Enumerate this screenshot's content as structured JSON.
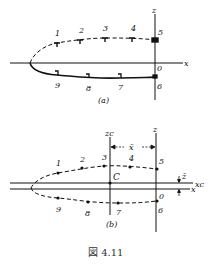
{
  "figure": {
    "caption": "図 4.11",
    "panel_a": {
      "label": "(a)",
      "x_axis_label": "x",
      "z_axis_label": "z",
      "origin_label": "0",
      "upper_points": [
        {
          "label": "1",
          "x": 57,
          "y": 43
        },
        {
          "label": "2",
          "x": 80,
          "y": 40
        },
        {
          "label": "3",
          "x": 105,
          "y": 38
        },
        {
          "label": "4",
          "x": 132,
          "y": 38
        },
        {
          "label": "5",
          "x": 155,
          "y": 40
        }
      ],
      "lower_points": [
        {
          "label": "9",
          "x": 57,
          "y": 75
        },
        {
          "label": "8",
          "x": 88,
          "y": 78
        },
        {
          "label": "7",
          "x": 120,
          "y": 78
        },
        {
          "label": "6",
          "x": 155,
          "y": 78
        }
      ]
    },
    "panel_b": {
      "label": "(b)",
      "x_axis_label": "x",
      "z_axis_label": "z",
      "xc_axis_label": "xc",
      "zc_axis_label": "zc",
      "centroid_label": "C",
      "origin_label": "0",
      "xbar_label": "x̄",
      "zbar_label": "z̄",
      "upper_points": [
        {
          "label": "1",
          "x": 58,
          "y": 173
        },
        {
          "label": "2",
          "x": 82,
          "y": 168
        },
        {
          "label": "3",
          "x": 104,
          "y": 166
        },
        {
          "label": "4",
          "x": 130,
          "y": 167
        },
        {
          "label": "5",
          "x": 157,
          "y": 169
        }
      ],
      "lower_points": [
        {
          "label": "9",
          "x": 58,
          "y": 198
        },
        {
          "label": "8",
          "x": 88,
          "y": 202
        },
        {
          "label": "7",
          "x": 118,
          "y": 203
        },
        {
          "label": "6",
          "x": 157,
          "y": 201
        }
      ]
    }
  }
}
